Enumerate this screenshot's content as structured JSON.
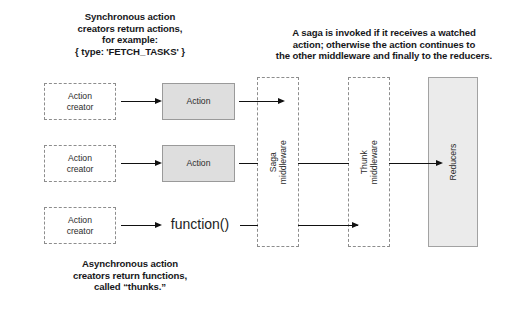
{
  "captions": {
    "sync": {
      "name": "synchronous-action-creators-caption",
      "lines": [
        "Synchronous action",
        "creators return actions,",
        "for example:",
        "{ type: 'FETCH_TASKS' }"
      ]
    },
    "saga": {
      "name": "saga-explanation-caption",
      "lines": [
        "A saga is invoked if it receives a watched",
        "action; otherwise the action continues to",
        "the other middleware and finally to the reducers."
      ]
    },
    "async": {
      "name": "asynchronous-action-creators-caption",
      "lines": [
        "Asynchronous action",
        "creators return functions,",
        "called “thunks.”"
      ]
    }
  },
  "nodes": {
    "action_creator_1": "Action\ncreator",
    "action_creator_2": "Action\ncreator",
    "action_creator_3": "Action\ncreator",
    "action_1": "Action",
    "action_2": "Action",
    "function_call": "function()",
    "saga_middleware": "Saga\nmiddleware",
    "thunk_middleware": "Thunk\nmiddleware",
    "reducers": "Reducers"
  },
  "colors": {
    "background": "#ffffff",
    "dashed_border": "#8d8d8d",
    "action_fill": "#dedede",
    "action_border": "#9a9a9a",
    "reducers_fill": "#ebebeb",
    "reducers_border": "#a2a2a2",
    "arrow": "#111111",
    "caption_text": "#17171a",
    "node_text": "#2b2b2b"
  }
}
